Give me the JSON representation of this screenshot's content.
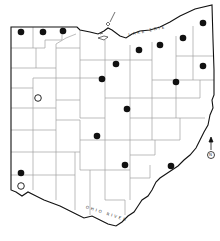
{
  "map": {
    "region": "Ohio",
    "subdivisions": "counties",
    "labels": {
      "lake": "LAKE ERIE",
      "river": "OHIO RIVER",
      "north": "N"
    },
    "legend_symbols": {
      "filled": "filled-dot",
      "open": "open-circle"
    },
    "colors": {
      "ink": "#111111",
      "county_line": "#9a9a9a",
      "background": "#ffffff"
    },
    "points_filled": [
      {
        "x": 21,
        "y": 32
      },
      {
        "x": 43,
        "y": 32
      },
      {
        "x": 63,
        "y": 31
      },
      {
        "x": 116,
        "y": 64
      },
      {
        "x": 139,
        "y": 50
      },
      {
        "x": 160,
        "y": 45
      },
      {
        "x": 183,
        "y": 38
      },
      {
        "x": 203,
        "y": 23
      },
      {
        "x": 102,
        "y": 79
      },
      {
        "x": 203,
        "y": 66
      },
      {
        "x": 176,
        "y": 82
      },
      {
        "x": 127,
        "y": 109
      },
      {
        "x": 97,
        "y": 136
      },
      {
        "x": 21,
        "y": 173
      },
      {
        "x": 125,
        "y": 165
      },
      {
        "x": 171,
        "y": 166
      }
    ],
    "points_open": [
      {
        "x": 38,
        "y": 98
      },
      {
        "x": 21,
        "y": 186
      }
    ]
  }
}
